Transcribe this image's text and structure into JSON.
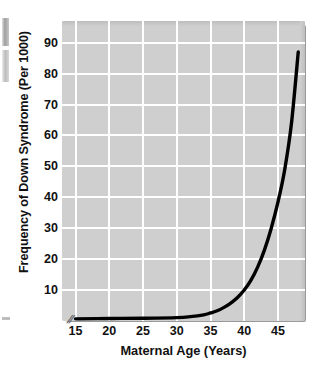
{
  "figure": {
    "name": "down-syndrome-frequency-vs-maternal-age",
    "background_color": "#ffffff",
    "plot_background_color": "#cfcfcf",
    "gridline_color": "#ffffff",
    "curve_color": "#000000",
    "axis_break_marker": "//"
  },
  "chart_data": {
    "type": "line",
    "title": "",
    "xlabel": "Maternal Age (Years)",
    "ylabel": "Frequency of Down Syndrome (Per 1000)",
    "xlim": [
      13,
      49
    ],
    "ylim": [
      0,
      97
    ],
    "xticks": [
      15,
      20,
      25,
      30,
      35,
      40,
      45
    ],
    "yticks": [
      10,
      20,
      30,
      40,
      50,
      60,
      70,
      80,
      90
    ],
    "xtick_labels": [
      "15",
      "20",
      "25",
      "30",
      "35",
      "40",
      "45"
    ],
    "ytick_labels": [
      "10",
      "20",
      "30",
      "40",
      "50",
      "60",
      "70",
      "80",
      "90"
    ],
    "grid": true,
    "legend": false,
    "series": [
      {
        "name": "Frequency of Down Syndrome per 1000 births",
        "x": [
          15,
          20,
          25,
          30,
          32,
          34,
          35,
          36,
          37,
          38,
          39,
          40,
          41,
          42,
          43,
          44,
          45,
          46,
          47,
          48
        ],
        "y": [
          0.7,
          0.8,
          0.9,
          1.1,
          1.4,
          2.0,
          2.6,
          3.3,
          4.4,
          5.8,
          7.6,
          10.0,
          13.2,
          17.5,
          23.0,
          30.0,
          38.5,
          49.0,
          64.0,
          87.0
        ]
      }
    ]
  }
}
